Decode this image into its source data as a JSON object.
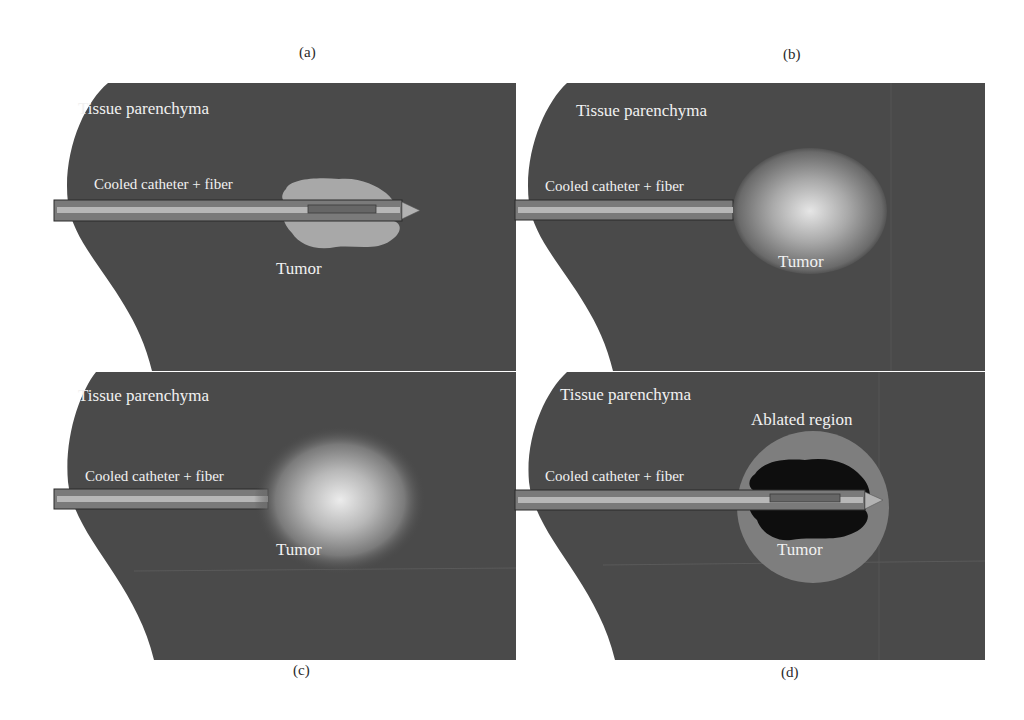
{
  "figure": {
    "colors": {
      "tissue": "#4a4a4a",
      "tumor_irregular": "#a8a8a8",
      "catheter_outer": "#7a7a7a",
      "catheter_inner": "#b5b5b5",
      "fiber": "#686868",
      "ablated_core": "#0e0e0e",
      "ablated_halo": "#7e7e7e",
      "label_text": "#f1f1f1",
      "background": "#ffffff"
    },
    "panels": [
      {
        "id": "a",
        "label": "(a)",
        "tissue_label": "Tissue parenchyma",
        "catheter_label": "Cooled catheter + fiber",
        "tumor_label": "Tumor",
        "tumor_style": "irregular-light"
      },
      {
        "id": "b",
        "label": "(b)",
        "tissue_label": "Tissue parenchyma",
        "catheter_label": "Cooled catheter + fiber",
        "tumor_label": "Tumor",
        "tumor_style": "spherical-gradient-with-dark-rim"
      },
      {
        "id": "c",
        "label": "(c)",
        "tissue_label": "Tissue parenchyma",
        "catheter_label": "Cooled catheter + fiber",
        "tumor_label": "Tumor",
        "tumor_style": "diffuse-glow"
      },
      {
        "id": "d",
        "label": "(d)",
        "tissue_label": "Tissue parenchyma",
        "catheter_label": "Cooled catheter + fiber",
        "tumor_label": "Tumor",
        "ablated_label": "Ablated region",
        "tumor_style": "ablated-dark-core-with-halo"
      }
    ]
  }
}
